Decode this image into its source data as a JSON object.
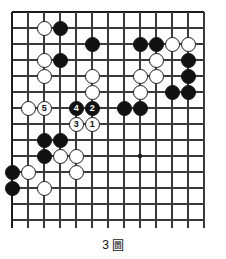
{
  "figure": {
    "caption_number": "3",
    "caption_glyph": "圖",
    "caption_full": "3 圖"
  },
  "board": {
    "type": "go-board-diagram",
    "cols": 13,
    "rows": 14,
    "cell_px": 16,
    "origin_x": 12,
    "origin_y": 12,
    "line_color": "#3a3a3a",
    "edge_color": "#1c1c1c",
    "background": "#ffffff",
    "star_points": [
      {
        "col": 9,
        "row": 10
      }
    ],
    "note_top_edge": "top board edge drawn as thick line",
    "note_bottom": "vertical lines extend past last horizontal line (diagram cropped)"
  },
  "stones": {
    "black": [
      {
        "col": 4,
        "row": 2
      },
      {
        "col": 6,
        "row": 3
      },
      {
        "col": 9,
        "row": 3
      },
      {
        "col": 10,
        "row": 3
      },
      {
        "col": 4,
        "row": 4
      },
      {
        "col": 12,
        "row": 4
      },
      {
        "col": 12,
        "row": 5
      },
      {
        "col": 11,
        "row": 6
      },
      {
        "col": 12,
        "row": 6
      },
      {
        "col": 8,
        "row": 7
      },
      {
        "col": 9,
        "row": 7
      },
      {
        "col": 3,
        "row": 9
      },
      {
        "col": 4,
        "row": 9
      },
      {
        "col": 3,
        "row": 10
      },
      {
        "col": 1,
        "row": 11
      },
      {
        "col": 1,
        "row": 12
      }
    ],
    "white": [
      {
        "col": 3,
        "row": 2
      },
      {
        "col": 11,
        "row": 3
      },
      {
        "col": 12,
        "row": 3
      },
      {
        "col": 3,
        "row": 4
      },
      {
        "col": 10,
        "row": 4
      },
      {
        "col": 3,
        "row": 5
      },
      {
        "col": 6,
        "row": 5
      },
      {
        "col": 9,
        "row": 5
      },
      {
        "col": 10,
        "row": 5
      },
      {
        "col": 6,
        "row": 6
      },
      {
        "col": 9,
        "row": 6
      },
      {
        "col": 2,
        "row": 7
      },
      {
        "col": 4,
        "row": 10
      },
      {
        "col": 5,
        "row": 10
      },
      {
        "col": 2,
        "row": 11
      },
      {
        "col": 5,
        "row": 11
      },
      {
        "col": 3,
        "row": 12
      }
    ],
    "numbered": [
      {
        "label": "1",
        "color": "white",
        "col": 6,
        "row": 8
      },
      {
        "label": "2",
        "color": "black",
        "col": 6,
        "row": 7
      },
      {
        "label": "3",
        "color": "white",
        "col": 5,
        "row": 8
      },
      {
        "label": "4",
        "color": "black",
        "col": 5,
        "row": 7
      },
      {
        "label": "5",
        "color": "white",
        "col": 3,
        "row": 7
      }
    ]
  }
}
